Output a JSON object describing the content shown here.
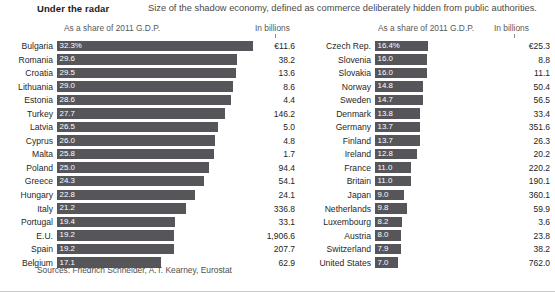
{
  "header": {
    "title": "Under the radar",
    "subtitle": "Size of the shadow economy, defined as commerce deliberately hidden from public authorities."
  },
  "columns": {
    "share_header": "As a share of 2011 G.D.P.",
    "billions_header": "In billions"
  },
  "footer": {
    "sources": "Sources: Friedrich Schneider, A.T. Kearney, Eurostat"
  },
  "chart_data": {
    "type": "bar",
    "title": "Under the radar",
    "subtitle": "Size of the shadow economy, defined as commerce deliberately hidden from public authorities.",
    "xlabel": "As a share of 2011 G.D.P.",
    "ylabel": "",
    "orientation": "horizontal",
    "grid": false,
    "legend": false,
    "bar_color": "#56565a",
    "panels": [
      {
        "name": "left",
        "share_header": "As a share of 2011 G.D.P.",
        "billions_header": "In billions",
        "axis_max": 32.3,
        "categories": [
          "Bulgaria",
          "Romania",
          "Croatia",
          "Lithuania",
          "Estonia",
          "Turkey",
          "Latvia",
          "Cyprus",
          "Malta",
          "Poland",
          "Greece",
          "Hungary",
          "Italy",
          "Portugal",
          "E.U.",
          "Spain",
          "Belgium"
        ],
        "values": [
          32.3,
          29.6,
          29.5,
          29.0,
          28.6,
          27.7,
          26.5,
          26.0,
          25.8,
          25.0,
          24.3,
          22.8,
          21.2,
          19.4,
          19.2,
          19.2,
          17.1
        ],
        "value_labels": [
          "32.3%",
          "29.6",
          "29.5",
          "29.0",
          "28.6",
          "27.7",
          "26.5",
          "26.0",
          "25.8",
          "25.0",
          "24.3",
          "22.8",
          "21.2",
          "19.4",
          "19.2",
          "19.2",
          "17.1"
        ],
        "billions": [
          "€11.6",
          "38.2",
          "13.6",
          "8.6",
          "4.4",
          "146.2",
          "5.0",
          "4.8",
          "1.7",
          "94.4",
          "54.1",
          "24.1",
          "336.8",
          "33.1",
          "1,906.6",
          "207.7",
          "62.9"
        ]
      },
      {
        "name": "right",
        "share_header": "As a share of 2011 G.D.P.",
        "billions_header": "In billions",
        "axis_max": 32.3,
        "categories": [
          "Czech Rep.",
          "Slovenia",
          "Slovakia",
          "Norway",
          "Sweden",
          "Denmark",
          "Germany",
          "Finland",
          "Ireland",
          "France",
          "Britain",
          "Japan",
          "Netherlands",
          "Luxembourg",
          "Austria",
          "Switzerland",
          "United States"
        ],
        "values": [
          16.4,
          16.0,
          16.0,
          14.8,
          14.7,
          13.8,
          13.7,
          13.7,
          12.8,
          11.0,
          11.0,
          9.0,
          9.8,
          8.2,
          8.0,
          7.9,
          7.0
        ],
        "value_labels": [
          "16.4%",
          "16.0",
          "16.0",
          "14.8",
          "14.7",
          "13.8",
          "13.7",
          "13.7",
          "12.8",
          "11.0",
          "11.0",
          "9.0",
          "9.8",
          "8.2",
          "8.0",
          "7.9",
          "7.0"
        ],
        "billions": [
          "€25.3",
          "8.8",
          "11.1",
          "50.4",
          "56.5",
          "33.4",
          "351.6",
          "26.3",
          "20.2",
          "220.2",
          "190.1",
          "360.1",
          "59.9",
          "3.6",
          "23.8",
          "38.2",
          "762.0"
        ]
      }
    ]
  }
}
